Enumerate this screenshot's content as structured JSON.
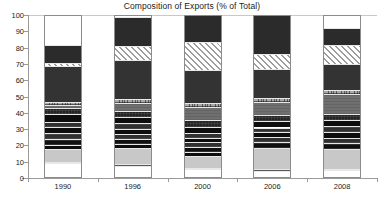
{
  "chart_data": {
    "type": "bar",
    "subtype": "stacked-100-percent",
    "title": "Composition of Exports (% of Total)",
    "xlabel": "",
    "ylabel": "",
    "ylim": [
      0,
      100
    ],
    "yticks": [
      0,
      10,
      20,
      30,
      40,
      50,
      60,
      70,
      80,
      90,
      100
    ],
    "ytick_labels": [
      "0",
      "10",
      "20",
      "30",
      "40",
      "50",
      "60",
      "70",
      "80",
      "90",
      "100"
    ],
    "grid": false,
    "legend": "none",
    "categories": [
      "1990",
      "1996",
      "2000",
      "2006",
      "2008"
    ],
    "series": [
      {
        "name": "Segment 1",
        "pattern": "white",
        "values": [
          9.0,
          7.5,
          5.5,
          4.5,
          5.0
        ]
      },
      {
        "name": "Segment 2",
        "pattern": "mid-gray",
        "values": [
          1.0,
          0.8,
          0.8,
          0.8,
          0.8
        ]
      },
      {
        "name": "Segment 3",
        "pattern": "light-gray",
        "values": [
          8.0,
          10.2,
          7.5,
          13.2,
          12.0
        ]
      },
      {
        "name": "Segment 4",
        "pattern": "solid-black",
        "values": [
          2.5,
          2.5,
          2.0,
          0.0,
          0.0
        ]
      },
      {
        "name": "Segment 5",
        "pattern": "black-tex",
        "values": [
          3.5,
          3.0,
          3.0,
          3.5,
          3.5
        ]
      },
      {
        "name": "Segment 6",
        "pattern": "dark-tex",
        "values": [
          3.5,
          3.0,
          3.0,
          3.0,
          3.5
        ]
      },
      {
        "name": "Segment 7",
        "pattern": "solid-black",
        "values": [
          3.5,
          3.0,
          3.0,
          3.0,
          3.5
        ]
      },
      {
        "name": "Segment 8",
        "pattern": "dark-tex",
        "values": [
          3.5,
          3.5,
          3.0,
          3.0,
          3.5
        ]
      },
      {
        "name": "Segment 9",
        "pattern": "solid-black",
        "values": [
          4.5,
          4.0,
          3.5,
          4.0,
          4.0
        ]
      },
      {
        "name": "Segment 10",
        "pattern": "vdark-tex",
        "values": [
          4.0,
          3.5,
          4.0,
          3.5,
          3.5
        ]
      },
      {
        "name": "Segment 11",
        "pattern": "gray-tex",
        "values": [
          1.5,
          5.0,
          8.5,
          8.0,
          12.5
        ]
      },
      {
        "name": "Segment 12",
        "pattern": "crosshatch",
        "values": [
          2.0,
          2.5,
          2.0,
          2.5,
          2.5
        ]
      },
      {
        "name": "Segment 13",
        "pattern": "dark-gray",
        "values": [
          22.5,
          24.0,
          20.5,
          18.0,
          15.5
        ]
      },
      {
        "name": "Segment 14",
        "pattern": "hatch-diag",
        "values": [
          1.5,
          8.5,
          17.0,
          9.0,
          12.0
        ]
      },
      {
        "name": "Segment 15",
        "pattern": "solid-dark",
        "values": [
          11.0,
          18.0,
          17.0,
          24.0,
          10.0
        ]
      }
    ]
  }
}
